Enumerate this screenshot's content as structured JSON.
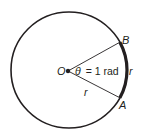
{
  "diagram": {
    "colors": {
      "stroke": "#231f20",
      "background": "#ffffff"
    },
    "angle_radians": 1,
    "labels": {
      "center": "O",
      "point_a": "A",
      "point_b": "B",
      "radius_label": "r",
      "arc_label": "r",
      "theta_symbol": "θ",
      "theta_eq": "= 1 rad"
    }
  }
}
